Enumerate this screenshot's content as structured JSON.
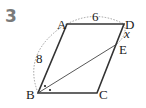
{
  "problem_number": "3",
  "diagram": {
    "shape": "parallelogram",
    "vertices": {
      "A": "A",
      "B": "B",
      "C": "C",
      "D": "D",
      "E": "E"
    },
    "lengths": {
      "AB": "8",
      "AD": "6",
      "DE": "x"
    }
  }
}
